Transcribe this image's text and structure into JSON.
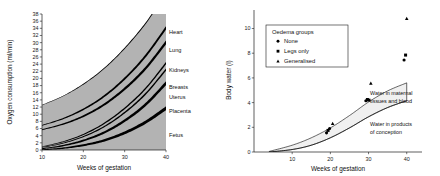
{
  "chart_data": [
    {
      "id": "oxygen-consumption",
      "type": "area",
      "title": "",
      "xlabel": "Weeks of gestation",
      "ylabel": "Oxygen consumption (ml/min)",
      "xlim": [
        10,
        40
      ],
      "ylim": [
        0,
        38
      ],
      "xticks": [
        10,
        20,
        30,
        40
      ],
      "yticks": [
        0,
        2,
        4,
        6,
        8,
        10,
        12,
        14,
        16,
        18,
        20,
        22,
        24,
        26,
        28,
        30,
        32,
        34,
        36,
        38
      ],
      "grid": false,
      "legend_position": "right-inline",
      "stacked": true,
      "x": [
        10,
        15,
        20,
        25,
        30,
        35,
        40
      ],
      "series": [
        {
          "name": "Fetus",
          "label": "Fetus",
          "values": [
            0.2,
            0.7,
            1.6,
            3.0,
            5.2,
            8.2,
            12.2
          ]
        },
        {
          "name": "Placenta",
          "label": "Placenta",
          "values": [
            0.3,
            0.7,
            1.3,
            2.2,
            3.4,
            4.9,
            7.0
          ]
        },
        {
          "name": "Uterus",
          "label": "Uterus",
          "values": [
            0.3,
            0.6,
            1.0,
            1.5,
            2.1,
            2.8,
            3.6
          ]
        },
        {
          "name": "Breasts",
          "label": "Breasts",
          "values": [
            0.2,
            0.4,
            0.6,
            0.9,
            1.2,
            1.5,
            1.8
          ]
        },
        {
          "name": "Kidneys",
          "label": "Kidneys",
          "values": [
            4.8,
            5.0,
            5.2,
            5.4,
            5.6,
            5.8,
            6.0
          ]
        },
        {
          "name": "Lung",
          "label": "Lung",
          "values": [
            1.2,
            1.5,
            1.9,
            2.3,
            2.8,
            3.4,
            4.0
          ]
        },
        {
          "name": "Heart",
          "label": "Heart",
          "values": [
            5.6,
            6.2,
            6.9,
            7.6,
            8.3,
            8.9,
            9.4
          ]
        }
      ],
      "labels_order": [
        "Heart",
        "Lung",
        "Kidneys",
        "Breasts",
        "Uterus",
        "Placenta",
        "Fetus"
      ]
    },
    {
      "id": "body-water",
      "type": "scatter",
      "title": "",
      "xlabel": "Weeks of gestation",
      "ylabel": "Body water (l)",
      "xlim": [
        0,
        44
      ],
      "ylim": [
        0,
        11.5
      ],
      "xticks": [
        10,
        20,
        30,
        40
      ],
      "yticks": [
        0,
        2,
        4,
        6,
        8,
        10
      ],
      "grid": false,
      "legend_position": "upper-left",
      "legend_title": "Oedema groups",
      "legend_entries": [
        {
          "label": "None",
          "marker": "circle"
        },
        {
          "label": "Legs only",
          "marker": "square"
        },
        {
          "label": "Generalised",
          "marker": "triangle"
        }
      ],
      "annotations": [
        {
          "text": "Water in maternal tissues and blood",
          "lines": [
            "Water in maternal",
            "tissues and blood"
          ]
        },
        {
          "text": "Water in products of conception",
          "lines": [
            "Water in products",
            "of conception"
          ]
        }
      ],
      "bands": [
        {
          "name": "Water in maternal tissues and blood",
          "x": [
            4,
            10,
            15,
            20,
            25,
            30,
            35,
            40
          ],
          "upper": [
            0.05,
            0.55,
            1.15,
            1.95,
            2.95,
            4.05,
            4.95,
            5.6
          ],
          "lower": [
            0.0,
            0.2,
            0.55,
            1.15,
            1.95,
            2.85,
            3.6,
            4.15
          ]
        },
        {
          "name": "Water in products of conception",
          "x": [
            4,
            10,
            15,
            20,
            25,
            30,
            35,
            40
          ],
          "upper": [
            0.0,
            0.2,
            0.55,
            1.15,
            1.95,
            2.85,
            3.6,
            4.15
          ],
          "lower": [
            0.0,
            0.0,
            0.0,
            0.0,
            0.0,
            0.0,
            0.0,
            0.0
          ]
        }
      ],
      "points": [
        {
          "x": 19.0,
          "y": 1.55,
          "marker": "circle"
        },
        {
          "x": 19.4,
          "y": 1.75,
          "marker": "square"
        },
        {
          "x": 19.8,
          "y": 1.9,
          "marker": "circle"
        },
        {
          "x": 20.6,
          "y": 2.3,
          "marker": "triangle"
        },
        {
          "x": 29.3,
          "y": 4.15,
          "marker": "circle"
        },
        {
          "x": 29.7,
          "y": 4.25,
          "marker": "square"
        },
        {
          "x": 30.1,
          "y": 4.2,
          "marker": "square"
        },
        {
          "x": 30.6,
          "y": 5.55,
          "marker": "triangle"
        },
        {
          "x": 39.3,
          "y": 7.45,
          "marker": "circle"
        },
        {
          "x": 39.7,
          "y": 7.85,
          "marker": "square"
        },
        {
          "x": 40.0,
          "y": 10.8,
          "marker": "triangle"
        }
      ]
    }
  ],
  "colors": {
    "band_fill": "#b3b3b3",
    "dark_band": "#000000",
    "axis": "#1a1a1a",
    "text": "#111111",
    "legend_bg": "#ffffff",
    "scatter_band_fill": "#f0f0f0"
  }
}
